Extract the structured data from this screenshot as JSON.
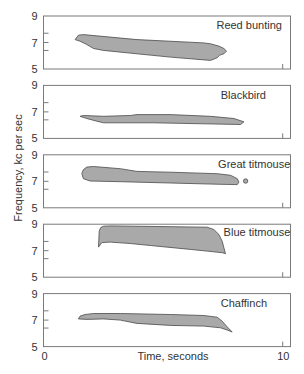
{
  "chart_data": {
    "type": "area",
    "title": "",
    "xlabel": "Time, seconds",
    "ylabel": "Frequency, kc per sec",
    "xlim": [
      0,
      10
    ],
    "ylim": [
      5,
      9
    ],
    "x_ticks": [
      0,
      10
    ],
    "x_tick_labels": [
      "0",
      "10"
    ],
    "y_ticks": [
      9,
      7,
      5
    ],
    "y_tick_labels": [
      "9",
      "7",
      "5"
    ],
    "y_minor_ticks": [
      7.7,
      7.0,
      6.4
    ],
    "grid": false,
    "legend": null,
    "layout": "5 stacked panels sharing the time axis; each panel labeled with bird name at upper right",
    "series": [
      {
        "name": "Reed bunting",
        "label_pos": [
          7.23,
          8.29
        ],
        "outline": [
          [
            1.32,
            7.22
          ],
          [
            1.46,
            7.55
          ],
          [
            1.67,
            7.6
          ],
          [
            3.91,
            7.22
          ],
          [
            6.7,
            6.97
          ],
          [
            6.98,
            6.9
          ],
          [
            7.33,
            6.73
          ],
          [
            7.54,
            6.55
          ],
          [
            7.65,
            6.35
          ],
          [
            7.54,
            6.15
          ],
          [
            7.37,
            6.05
          ],
          [
            7.26,
            5.85
          ],
          [
            6.98,
            5.65
          ],
          [
            5.3,
            5.9
          ],
          [
            3.91,
            6.15
          ],
          [
            2.51,
            6.4
          ],
          [
            2.09,
            6.55
          ],
          [
            1.81,
            6.85
          ],
          [
            1.53,
            7.1
          ]
        ]
      },
      {
        "name": "Blackbird",
        "label_pos": [
          7.41,
          8.3
        ],
        "outline": [
          [
            1.53,
            6.67
          ],
          [
            1.67,
            6.73
          ],
          [
            2.51,
            6.67
          ],
          [
            3.63,
            6.73
          ],
          [
            3.91,
            6.8
          ],
          [
            5.3,
            6.8
          ],
          [
            6.98,
            6.67
          ],
          [
            7.96,
            6.5
          ],
          [
            8.38,
            6.25
          ],
          [
            8.24,
            6.05
          ],
          [
            6.7,
            6.1
          ],
          [
            4.6,
            6.18
          ],
          [
            2.51,
            6.18
          ],
          [
            2.23,
            6.3
          ],
          [
            1.81,
            6.5
          ]
        ]
      },
      {
        "name": "Great titmouse",
        "label_pos": [
          7.3,
          8.31
        ],
        "outline": [
          [
            1.67,
            7.88
          ],
          [
            1.81,
            8.07
          ],
          [
            2.09,
            8.12
          ],
          [
            3.21,
            7.95
          ],
          [
            3.91,
            7.75
          ],
          [
            5.3,
            7.69
          ],
          [
            7.26,
            7.57
          ],
          [
            7.82,
            7.45
          ],
          [
            8.1,
            7.2
          ],
          [
            8.17,
            6.94
          ],
          [
            8.1,
            6.75
          ],
          [
            7.4,
            6.77
          ],
          [
            5.3,
            6.87
          ],
          [
            3.21,
            6.97
          ],
          [
            1.95,
            7.02
          ],
          [
            1.67,
            7.2
          ],
          [
            1.6,
            7.58
          ]
        ],
        "dot": [
          8.45,
          7.02
        ]
      },
      {
        "name": "Blue titmouse",
        "label_pos": [
          7.53,
          8.44
        ],
        "outline": [
          [
            2.3,
            7.27
          ],
          [
            2.33,
            8.47
          ],
          [
            2.39,
            8.74
          ],
          [
            2.51,
            8.85
          ],
          [
            2.79,
            8.87
          ],
          [
            4.75,
            8.83
          ],
          [
            6.84,
            8.77
          ],
          [
            7.12,
            8.6
          ],
          [
            7.33,
            8.23
          ],
          [
            7.47,
            7.72
          ],
          [
            7.54,
            7.22
          ],
          [
            7.61,
            6.77
          ],
          [
            7.47,
            6.85
          ],
          [
            6.84,
            6.97
          ],
          [
            6.14,
            7.1
          ],
          [
            4.47,
            7.39
          ],
          [
            3.63,
            7.54
          ],
          [
            2.79,
            7.65
          ],
          [
            2.44,
            7.61
          ]
        ]
      },
      {
        "name": "Chaffinch",
        "label_pos": [
          7.41,
          8.31
        ],
        "outline": [
          [
            1.46,
            7.09
          ],
          [
            1.53,
            7.3
          ],
          [
            1.74,
            7.42
          ],
          [
            2.09,
            7.5
          ],
          [
            3.21,
            7.5
          ],
          [
            5.3,
            7.42
          ],
          [
            6.7,
            7.35
          ],
          [
            7.26,
            7.22
          ],
          [
            7.47,
            6.92
          ],
          [
            7.68,
            6.49
          ],
          [
            7.89,
            6.1
          ],
          [
            7.68,
            6.25
          ],
          [
            7.4,
            6.42
          ],
          [
            6.7,
            6.55
          ],
          [
            5.3,
            6.6
          ],
          [
            3.91,
            6.75
          ],
          [
            3.21,
            7.0
          ],
          [
            2.51,
            7.09
          ],
          [
            1.81,
            7.05
          ]
        ]
      }
    ]
  }
}
